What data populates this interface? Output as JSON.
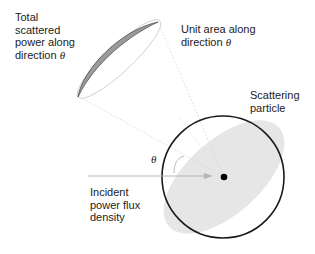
{
  "diagram": {
    "labels": {
      "total_scattered": [
        "Total",
        "scattered",
        "power along",
        "direction"
      ],
      "unit_area": [
        "Unit area along",
        "direction"
      ],
      "scattering_particle": [
        "Scattering",
        "particle"
      ],
      "incident": [
        "Incident",
        "power flux",
        "density"
      ],
      "theta": "θ"
    },
    "colors": {
      "circle_stroke": "#1a1a1a",
      "lobe_fill": "#e4e4e4",
      "ellipse_fill": "#999999",
      "arrow": "#b5b5b5",
      "cone_lines": "#d0d0d0",
      "particle": "#000000"
    }
  }
}
